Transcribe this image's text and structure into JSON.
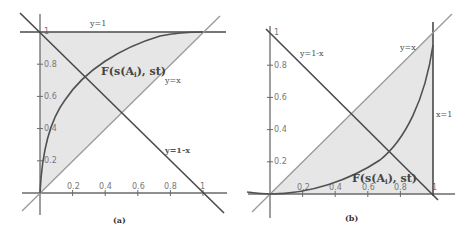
{
  "figure": {
    "panels": [
      {
        "caption": "(a)",
        "curve_label": "F(s(A",
        "curve_label_sub": "i",
        "curve_label_tail": "), st)",
        "line_labels": {
          "top": "y=1",
          "diag": "y=x",
          "anti": "y=1-x"
        },
        "x_ticks": [
          "0.2",
          "0.4",
          "0.6",
          "0.8",
          "1"
        ],
        "y_ticks": [
          "0.2",
          "0.4",
          "0.6",
          "0.8",
          "1"
        ]
      },
      {
        "caption": "(b)",
        "curve_label": "F(s(A",
        "curve_label_sub": "i",
        "curve_label_tail": "), st)",
        "line_labels": {
          "right": "x=1",
          "diag": "y=x",
          "anti": "y=1-x"
        },
        "x_ticks": [
          "0.2",
          "0.4",
          "0.6",
          "0.8",
          "1"
        ],
        "y_ticks": [
          "0.2",
          "0.4",
          "0.6",
          "0.8",
          "1"
        ]
      }
    ]
  },
  "colors": {
    "shade": "#e6e6e6",
    "curve": "#505050",
    "axis": "#6a6a6a"
  }
}
